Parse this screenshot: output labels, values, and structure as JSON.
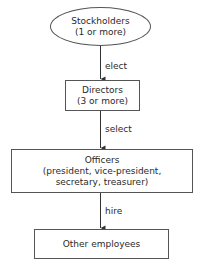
{
  "diagram": {
    "type": "organizational-flowchart",
    "nodes": [
      {
        "id": "stockholders",
        "shape": "ellipse",
        "title": "Stockholders",
        "subtitle": "(1 or more)"
      },
      {
        "id": "directors",
        "shape": "rectangle",
        "title": "Directors",
        "subtitle": "(3 or more)"
      },
      {
        "id": "officers",
        "shape": "rectangle",
        "title": "Officers",
        "subtitle_line1": "(president, vice-president,",
        "subtitle_line2": "secretary, treasurer)"
      },
      {
        "id": "other_employees",
        "shape": "rectangle",
        "title": "Other employees"
      }
    ],
    "edges": [
      {
        "from": "stockholders",
        "to": "directors",
        "label": "elect"
      },
      {
        "from": "directors",
        "to": "officers",
        "label": "select"
      },
      {
        "from": "officers",
        "to": "other_employees",
        "label": "hire"
      }
    ],
    "colors": {
      "stroke": "#555555",
      "text": "#2a2a2a",
      "background": "#ffffff"
    }
  }
}
